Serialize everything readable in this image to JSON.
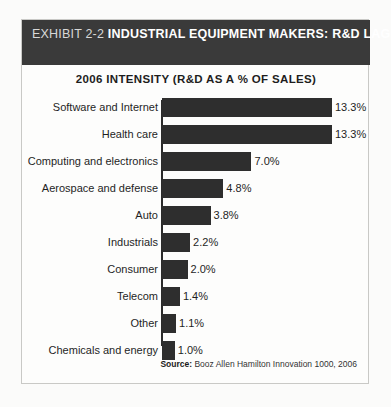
{
  "header": {
    "exhibit_number": "EXHIBIT 2-2",
    "title": "INDUSTRIAL EQUIPMENT MAKERS: R&D LAGGARDS",
    "background_color": "#3a3a3a",
    "text_color": "#ffffff"
  },
  "subtitle": "2006 INTENSITY (R&D AS A % OF SALES)",
  "source": {
    "label": "Source:",
    "text": "Booz Allen Hamilton Innovation 1000, 2006"
  },
  "colors": {
    "bar": "#2e2e2e",
    "axis": "#2b2b2b",
    "frame": "#c9c9c6",
    "page": "#fbfbfa"
  },
  "chart_data": {
    "type": "bar",
    "orientation": "horizontal",
    "title": "EXHIBIT 2-2 INDUSTRIAL EQUIPMENT MAKERS: R&D LAGGARDS",
    "subtitle": "2006 INTENSITY (R&D AS A % OF SALES)",
    "xlabel": "",
    "ylabel": "",
    "xlim": [
      0,
      13.3
    ],
    "grid": false,
    "legend": false,
    "value_labels": true,
    "value_suffix": "%",
    "categories": [
      "Software and Internet",
      "Health care",
      "Computing and electronics",
      "Aerospace and defense",
      "Auto",
      "Industrials",
      "Consumer",
      "Telecom",
      "Other",
      "Chemicals and energy"
    ],
    "values": [
      13.3,
      13.3,
      7.0,
      4.8,
      3.8,
      2.2,
      2.0,
      1.4,
      1.1,
      1.0
    ],
    "labels": [
      "13.3%",
      "13.3%",
      "7.0%",
      "4.8%",
      "3.8%",
      "2.2%",
      "2.0%",
      "1.4%",
      "1.1%",
      "1.0%"
    ],
    "source": "Source: Booz Allen Hamilton Innovation 1000, 2006"
  }
}
